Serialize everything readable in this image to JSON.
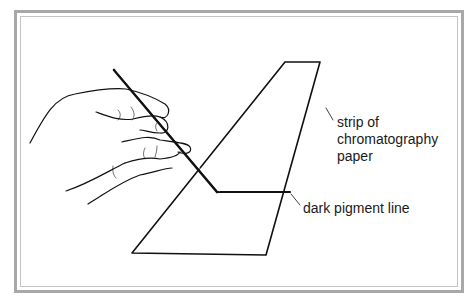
{
  "diagram": {
    "labels": {
      "paper_strip": [
        "strip of",
        "chromatography",
        "paper"
      ],
      "pigment_line": "dark pigment line"
    },
    "colors": {
      "stroke": "#111111",
      "frame": "#a8a8a8"
    }
  }
}
